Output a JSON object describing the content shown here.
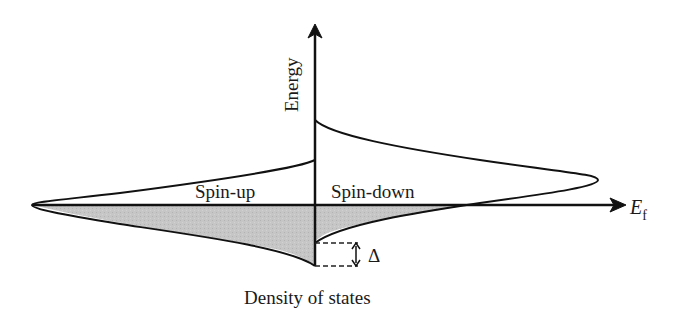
{
  "diagram": {
    "type": "spin-split density of states",
    "labels": {
      "y_axis": "Energy",
      "x_axis": "Density of states",
      "fermi_level_main": "E",
      "fermi_level_sub": "f",
      "left_band": "Spin-up",
      "right_band": "Spin-down",
      "exchange_splitting": "Δ"
    },
    "colors": {
      "line": "#111111",
      "fill_occupied": "#c4c4c4",
      "background": "#ffffff"
    }
  }
}
